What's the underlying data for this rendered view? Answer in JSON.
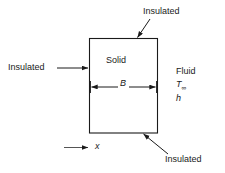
{
  "figure": {
    "colors": {
      "background": "#ffffff",
      "line": "#1a1a1a",
      "text": "#1a1a1a"
    },
    "body": {
      "label": "Solid",
      "shape": "rectangle"
    },
    "dimension": {
      "label": "B",
      "style": "double-headed-arrow"
    },
    "axis": {
      "label": "x",
      "style": "single-headed-arrow",
      "direction": "right"
    },
    "boundaries": [
      {
        "name": "top",
        "label": "Insulated"
      },
      {
        "name": "left",
        "label": "Insulated"
      },
      {
        "name": "bottom",
        "label": "Insulated"
      }
    ],
    "fluid": {
      "label": "Fluid",
      "temperature_symbol": "T",
      "temperature_subscript": "∞",
      "coefficient_symbol": "h"
    }
  }
}
